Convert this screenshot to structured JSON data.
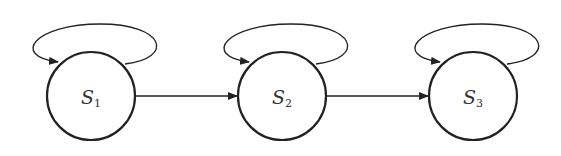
{
  "diagram": {
    "type": "state-transition",
    "states": [
      {
        "id": "S1",
        "label": "S",
        "subscript": "1",
        "cx": 91,
        "cy": 96
      },
      {
        "id": "S2",
        "label": "S",
        "subscript": "2",
        "cx": 282,
        "cy": 96
      },
      {
        "id": "S3",
        "label": "S",
        "subscript": "3",
        "cx": 473,
        "cy": 96
      }
    ],
    "transitions": [
      {
        "from": "S1",
        "to": "S1",
        "kind": "self-loop"
      },
      {
        "from": "S2",
        "to": "S2",
        "kind": "self-loop"
      },
      {
        "from": "S3",
        "to": "S3",
        "kind": "self-loop"
      },
      {
        "from": "S1",
        "to": "S2",
        "kind": "arrow"
      },
      {
        "from": "S2",
        "to": "S3",
        "kind": "arrow"
      }
    ],
    "colors": {
      "stroke": "#222222",
      "background": "#ffffff"
    }
  }
}
